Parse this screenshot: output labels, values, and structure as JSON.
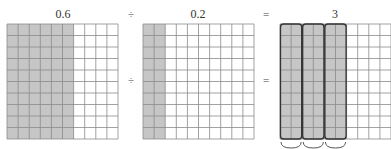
{
  "equation": {
    "dividend_label": "0.6",
    "divide_symbol": "÷",
    "divisor_label": "0.2",
    "equals_symbol": "=",
    "quotient_label": "3"
  },
  "grids": [
    {
      "name": "dividend-grid",
      "rows": 10,
      "cols": 10,
      "shaded_columns": 6,
      "groups": 0
    },
    {
      "name": "divisor-grid",
      "rows": 10,
      "cols": 10,
      "shaded_columns": 2,
      "groups": 0
    },
    {
      "name": "quotient-grid",
      "rows": 10,
      "cols": 10,
      "shaded_columns": 6,
      "groups": 3,
      "group_size_columns": 2
    }
  ],
  "colors": {
    "shade": "#c6c6c6",
    "grid_line": "#8a8a8a",
    "group_outline": "#333333"
  }
}
